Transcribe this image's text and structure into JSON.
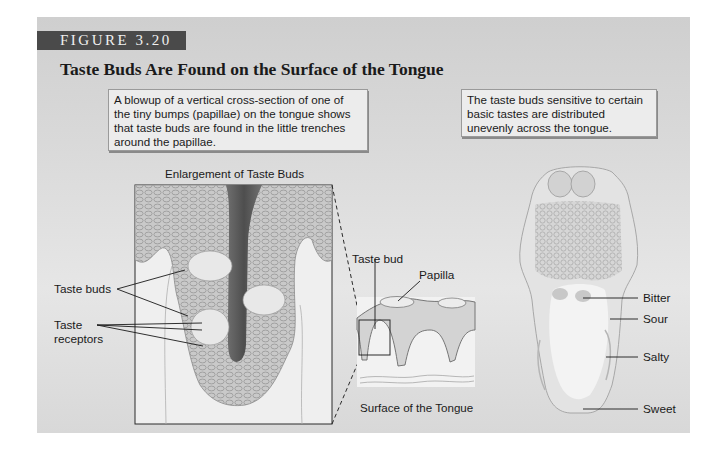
{
  "figure": {
    "label": "FIGURE 3.20",
    "title": "Taste Buds Are Found on the Surface of the Tongue"
  },
  "callouts": {
    "left": "A blowup of a vertical cross-section of one of the tiny bumps (papillae) on the tongue shows that taste buds are found in the little trenches around the papillae.",
    "right": "The taste buds sensitive to certain basic tastes are distributed unevenly across the tongue."
  },
  "enlargement": {
    "caption": "Enlargement of Taste Buds",
    "labels": {
      "taste_buds": "Taste buds",
      "taste_receptors_line1": "Taste",
      "taste_receptors_line2": "receptors"
    }
  },
  "surface": {
    "caption": "Surface of the Tongue",
    "labels": {
      "taste_bud": "Taste bud",
      "papilla": "Papilla"
    }
  },
  "tongue_map": {
    "labels": [
      "Bitter",
      "Sour",
      "Salty",
      "Sweet"
    ]
  },
  "colors": {
    "panel_bg": "#d9d9d9",
    "label_bar": "#4a4a4a",
    "callout_bg": "#ececec"
  }
}
